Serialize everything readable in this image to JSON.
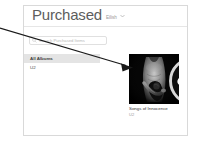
{
  "window": {
    "header": {
      "title": "Purchased",
      "account_name": "Eilish",
      "chevron_icon": "chevron-down-icon"
    },
    "search": {
      "icon": "search-icon",
      "placeholder": "Search Purchased Items",
      "value": ""
    },
    "sidebar": {
      "items": [
        {
          "label": "All Albums",
          "selected": true
        },
        {
          "label": "U2",
          "selected": false
        }
      ]
    },
    "albums": [
      {
        "title": "Songs of Innocence",
        "artist": "U2",
        "artwork_alt": "songs-of-innocence-cover",
        "download_icon": "cloud-download-icon"
      }
    ]
  },
  "annotation": {
    "type": "arrow",
    "color": "#1a1a1a",
    "from": {
      "x": 0,
      "y": 28
    },
    "to": {
      "x": 131,
      "y": 67
    }
  },
  "colors": {
    "panel_border": "#d9d9d9",
    "header_rule": "#e6e6e6",
    "selected_row": "#e4e4e4",
    "title_text": "#5d5d5d",
    "muted_text": "#9a9a9a",
    "artwork_bg": "#0a0a0a"
  }
}
